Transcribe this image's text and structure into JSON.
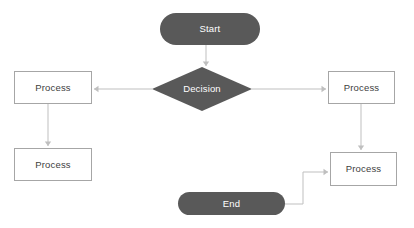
{
  "diagram": {
    "background_color": "#ffffff",
    "shape_fill_dark": "#595959",
    "shape_fill_light": "#ffffff",
    "shape_border_color": "#a6a6a6",
    "connector_color": "#bfbfbf",
    "label_color_on_dark": "#ffffff",
    "label_color_on_light": "#404040"
  },
  "nodes": [
    {
      "id": "start",
      "label": "Start",
      "shape": "terminator",
      "x": 160,
      "y": 13,
      "w": 100,
      "h": 32
    },
    {
      "id": "decision",
      "label": "Decision",
      "shape": "decision",
      "x": 152,
      "y": 67,
      "w": 100,
      "h": 44
    },
    {
      "id": "process_left",
      "label": "Process",
      "shape": "process",
      "x": 14,
      "y": 71,
      "w": 78,
      "h": 33
    },
    {
      "id": "process_right",
      "label": "Process",
      "shape": "process",
      "x": 328,
      "y": 71,
      "w": 67,
      "h": 33
    },
    {
      "id": "process_bottom_left",
      "label": "Process",
      "shape": "process",
      "x": 14,
      "y": 148,
      "w": 78,
      "h": 33
    },
    {
      "id": "process_bottom_right",
      "label": "Process",
      "shape": "process",
      "x": 330,
      "y": 152,
      "w": 67,
      "h": 34
    },
    {
      "id": "end",
      "label": "End",
      "shape": "terminator",
      "x": 178,
      "y": 192,
      "w": 107,
      "h": 23
    }
  ],
  "edges": [
    {
      "id": "start-to-decision",
      "from": "start",
      "to": "decision",
      "points": "206,45 206,66",
      "arrow": "down"
    },
    {
      "id": "decision-to-process-left",
      "from": "decision",
      "to": "process_left",
      "points": "152,89 94,89",
      "arrow": "left"
    },
    {
      "id": "decision-to-process-right",
      "from": "decision",
      "to": "process_right",
      "points": "252,89 326,89",
      "arrow": "right"
    },
    {
      "id": "process-left-to-process-bottom-left",
      "from": "process_left",
      "to": "process_bottom_left",
      "points": "48,104 48,146",
      "arrow": "down"
    },
    {
      "id": "process-right-to-process-bottom-right",
      "from": "process_right",
      "to": "process_bottom_right",
      "points": "361,104 361,150",
      "arrow": "down"
    },
    {
      "id": "end-to-process-bottom-right",
      "from": "end",
      "to": "process_bottom_right",
      "points": "285,204 303,204 303,172 328,172",
      "arrow": "right"
    }
  ]
}
